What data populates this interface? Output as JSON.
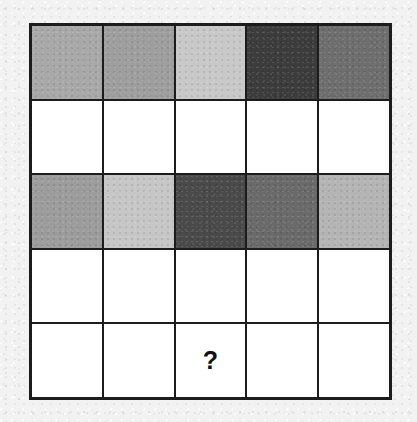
{
  "puzzle": {
    "type": "matrix-reasoning-grid",
    "rows": 5,
    "columns": 5,
    "background_color": "#F2F2F2",
    "grid_line_color": "#1C1C1C",
    "empty_cell_color": "#FFFFFF",
    "missing_cell_marker": "?",
    "missing_cell_position": {
      "row": 5,
      "column": 3
    },
    "cells": [
      [
        {
          "fill": "#A8A8A8",
          "shaded": true,
          "marker": ""
        },
        {
          "fill": "#9E9E9E",
          "shaded": true,
          "marker": ""
        },
        {
          "fill": "#C8C8C8",
          "shaded": true,
          "marker": ""
        },
        {
          "fill": "#3C3C3C",
          "shaded": true,
          "marker": ""
        },
        {
          "fill": "#6E6E6E",
          "shaded": true,
          "marker": ""
        }
      ],
      [
        {
          "fill": "#FFFFFF",
          "shaded": false,
          "marker": ""
        },
        {
          "fill": "#FFFFFF",
          "shaded": false,
          "marker": ""
        },
        {
          "fill": "#FFFFFF",
          "shaded": false,
          "marker": ""
        },
        {
          "fill": "#FFFFFF",
          "shaded": false,
          "marker": ""
        },
        {
          "fill": "#FFFFFF",
          "shaded": false,
          "marker": ""
        }
      ],
      [
        {
          "fill": "#9C9C9C",
          "shaded": true,
          "marker": ""
        },
        {
          "fill": "#C6C6C6",
          "shaded": true,
          "marker": ""
        },
        {
          "fill": "#4A4A4A",
          "shaded": true,
          "marker": ""
        },
        {
          "fill": "#6A6A6A",
          "shaded": true,
          "marker": ""
        },
        {
          "fill": "#B4B4B4",
          "shaded": true,
          "marker": ""
        }
      ],
      [
        {
          "fill": "#FFFFFF",
          "shaded": false,
          "marker": ""
        },
        {
          "fill": "#FFFFFF",
          "shaded": false,
          "marker": ""
        },
        {
          "fill": "#FFFFFF",
          "shaded": false,
          "marker": ""
        },
        {
          "fill": "#FFFFFF",
          "shaded": false,
          "marker": ""
        },
        {
          "fill": "#FFFFFF",
          "shaded": false,
          "marker": ""
        }
      ],
      [
        {
          "fill": "#FFFFFF",
          "shaded": false,
          "marker": ""
        },
        {
          "fill": "#FFFFFF",
          "shaded": false,
          "marker": ""
        },
        {
          "fill": "#FFFFFF",
          "shaded": false,
          "marker": "?"
        },
        {
          "fill": "#FFFFFF",
          "shaded": false,
          "marker": ""
        },
        {
          "fill": "#FFFFFF",
          "shaded": false,
          "marker": ""
        }
      ]
    ]
  }
}
